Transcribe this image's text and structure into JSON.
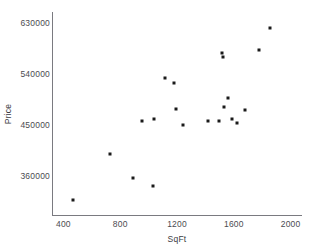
{
  "chart": {
    "title": "",
    "type_label": "scatter-plot"
  },
  "axes": {
    "x": {
      "label": "SqFt",
      "ticks": [
        "400",
        "800",
        "1200",
        "1600",
        "2000"
      ],
      "tick_values": [
        400,
        800,
        1200,
        1600,
        2000
      ],
      "min": 320,
      "max": 2080
    },
    "y": {
      "label": "Price",
      "ticks": [
        "630000",
        "540000",
        "450000",
        "360000"
      ],
      "tick_values": [
        630000,
        540000,
        450000,
        360000
      ],
      "min": 290000,
      "max": 650000
    }
  },
  "style": {
    "point_color": "#1a1a1a",
    "axis_color": "#7a7a80",
    "text_color": "#4b4b50",
    "background": "#ffffff"
  },
  "chart_data": {
    "type": "scatter",
    "title": "",
    "xlabel": "SqFt",
    "ylabel": "Price",
    "xlim": [
      320,
      2080
    ],
    "ylim": [
      290000,
      650000
    ],
    "xticks": [
      400,
      800,
      1200,
      1600,
      2000
    ],
    "yticks": [
      360000,
      450000,
      540000,
      630000
    ],
    "grid": false,
    "legend": false,
    "series": [
      {
        "name": "houses",
        "points": [
          {
            "x": 470,
            "y": 318000
          },
          {
            "x": 730,
            "y": 400000
          },
          {
            "x": 890,
            "y": 357000
          },
          {
            "x": 1030,
            "y": 343000
          },
          {
            "x": 955,
            "y": 458000
          },
          {
            "x": 1040,
            "y": 461000
          },
          {
            "x": 1115,
            "y": 533000
          },
          {
            "x": 1180,
            "y": 525000
          },
          {
            "x": 1195,
            "y": 478000
          },
          {
            "x": 1240,
            "y": 450000
          },
          {
            "x": 1415,
            "y": 458000
          },
          {
            "x": 1495,
            "y": 458000
          },
          {
            "x": 1520,
            "y": 578000
          },
          {
            "x": 1525,
            "y": 570000
          },
          {
            "x": 1530,
            "y": 483000
          },
          {
            "x": 1560,
            "y": 499000
          },
          {
            "x": 1585,
            "y": 462000
          },
          {
            "x": 1625,
            "y": 455000
          },
          {
            "x": 1680,
            "y": 477000
          },
          {
            "x": 1775,
            "y": 583000
          },
          {
            "x": 1855,
            "y": 622000
          }
        ]
      }
    ]
  }
}
